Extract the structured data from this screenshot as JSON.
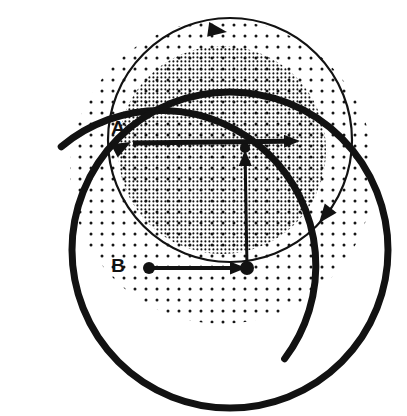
{
  "figure": {
    "background_color": "#ffffff",
    "ink_color": "#121212",
    "canvas": {
      "width": 407,
      "height": 416
    },
    "labels": {
      "point_a": "A",
      "point_b": "B"
    },
    "label_positions": {
      "point_a": {
        "x": 118,
        "y": 134
      },
      "point_b": {
        "x": 118,
        "y": 272
      }
    },
    "shapes": {
      "stipple_light": {
        "name": "light-stipple-region",
        "shape": "circle",
        "cx": 222,
        "cy": 172,
        "r": 152,
        "dot_spacing": 11,
        "dot_radius": 1.5,
        "density": "light"
      },
      "stipple_dark": {
        "name": "dark-stipple-region",
        "shape": "circle",
        "cx": 222,
        "cy": 150,
        "r": 104,
        "dot_spacing": 4,
        "dot_radius": 1.0,
        "density": "dense"
      },
      "thin_circle": {
        "name": "thin-circle",
        "cx": 230,
        "cy": 140,
        "r": 122,
        "stroke_width": 2.2
      },
      "thick_arc_left": {
        "name": "thick-open-arc-left",
        "cx": 185,
        "cy": 240,
        "r": 155,
        "stroke_width": 7,
        "start_deg": 143,
        "end_deg": 310
      },
      "thick_circle_right": {
        "name": "thick-circle-right",
        "cx": 230,
        "cy": 250,
        "r": 158,
        "stroke_width": 7
      }
    },
    "vectors": [
      {
        "id": "velocity-at-a",
        "name": "horizontal-velocity-arrow-at-a",
        "from": {
          "x": 133,
          "y": 143
        },
        "to": {
          "x": 300,
          "y": 141
        },
        "stroke_width": 5,
        "description": "horizontal velocity vector at point A"
      },
      {
        "id": "velocity-at-b",
        "name": "horizontal-velocity-arrow-at-b",
        "from": {
          "x": 150,
          "y": 268
        },
        "to": {
          "x": 246,
          "y": 268
        },
        "stroke_width": 4,
        "description": "horizontal velocity vector at point B"
      },
      {
        "id": "radial-upward",
        "name": "vertical-upward-arrow-to-center",
        "from": {
          "x": 247,
          "y": 267
        },
        "to": {
          "x": 245,
          "y": 150
        },
        "stroke_width": 3,
        "description": "vertical vector from B up to centre point"
      }
    ],
    "dots": [
      {
        "name": "centre-dot",
        "x": 245,
        "y": 148,
        "r": 5
      },
      {
        "name": "dot-b-left",
        "x": 149,
        "y": 268,
        "r": 6
      },
      {
        "name": "dot-b-right",
        "x": 247,
        "y": 268,
        "r": 7
      }
    ],
    "arc_arrowheads": [
      {
        "name": "arc-arrow-top",
        "x": 227,
        "y": 32,
        "angle_deg": 8,
        "description": "clockwise direction marker on top of thin circle"
      },
      {
        "name": "arc-arrow-lower-right",
        "x": 319,
        "y": 223,
        "angle_deg": 128,
        "description": "clockwise direction marker on lower-right of thin circle"
      },
      {
        "name": "arc-arrow-at-a",
        "x": 131,
        "y": 142,
        "angle_deg": -28,
        "description": "direction marker on thick arc arriving at A"
      }
    ]
  }
}
